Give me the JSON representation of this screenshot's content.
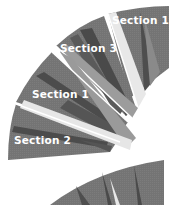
{
  "diagram": {
    "type": "radial-fan",
    "colors": {
      "dark": "#4a4a4a",
      "mid": "#6b6b6b",
      "base": "#7a7a7a",
      "light": "#9a9a9a",
      "pale": "#e6e6e6",
      "divider": "#ffffff",
      "label": "#ffffff"
    },
    "sections": [
      {
        "id": "top-right",
        "label": "Section 1"
      },
      {
        "id": "upper-middle",
        "label": "Section 3"
      },
      {
        "id": "middle-left",
        "label": "Section 1"
      },
      {
        "id": "lower-left",
        "label": "Section 2"
      }
    ]
  }
}
